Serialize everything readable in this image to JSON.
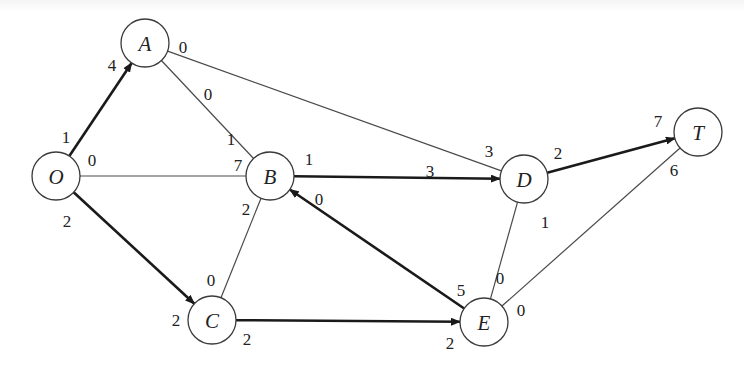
{
  "diagram": {
    "type": "network-flow",
    "colors": {
      "background": "#ffffff",
      "node_stroke": "#3a3a3a",
      "thin_edge": "#4a4a4a",
      "thick_edge": "#1a1a1a",
      "text": "#222222"
    },
    "nodes": [
      {
        "id": "O",
        "label": "O",
        "x": 56,
        "y": 176
      },
      {
        "id": "A",
        "label": "A",
        "x": 145,
        "y": 43
      },
      {
        "id": "B",
        "label": "B",
        "x": 270,
        "y": 176
      },
      {
        "id": "C",
        "label": "C",
        "x": 212,
        "y": 320
      },
      {
        "id": "D",
        "label": "D",
        "x": 524,
        "y": 179
      },
      {
        "id": "E",
        "label": "E",
        "x": 484,
        "y": 322
      },
      {
        "id": "T",
        "label": "T",
        "x": 698,
        "y": 132
      }
    ],
    "edges": [
      {
        "from": "O",
        "to": "A",
        "directed": true,
        "bold": true,
        "label_from": "1",
        "label_to": "4"
      },
      {
        "from": "O",
        "to": "B",
        "directed": false,
        "bold": false,
        "label_from": "0",
        "label_to": "7"
      },
      {
        "from": "O",
        "to": "C",
        "directed": true,
        "bold": true,
        "label_from": "2",
        "label_to": "2"
      },
      {
        "from": "A",
        "to": "B",
        "directed": false,
        "bold": false,
        "label_from": "0",
        "label_to": "1"
      },
      {
        "from": "A",
        "to": "D",
        "directed": false,
        "bold": false,
        "label_from": "0",
        "label_to": "3"
      },
      {
        "from": "B",
        "to": "D",
        "directed": true,
        "bold": true,
        "label_from": "1",
        "label_to": "3"
      },
      {
        "from": "B",
        "to": "C",
        "directed": false,
        "bold": false,
        "label_from": "2",
        "label_to": "0"
      },
      {
        "from": "E",
        "to": "B",
        "directed": true,
        "bold": true,
        "label_from": "5",
        "label_to": "0"
      },
      {
        "from": "C",
        "to": "E",
        "directed": true,
        "bold": true,
        "label_from": "2",
        "label_to": "2"
      },
      {
        "from": "D",
        "to": "T",
        "directed": true,
        "bold": true,
        "label_from": "2",
        "label_to": "7"
      },
      {
        "from": "D",
        "to": "E",
        "directed": false,
        "bold": false,
        "label_from": "1",
        "label_to": "0"
      },
      {
        "from": "E",
        "to": "T",
        "directed": false,
        "bold": false,
        "label_from": "0",
        "label_to": "6"
      }
    ],
    "labels": [
      {
        "text": "1",
        "x": 66,
        "y": 137
      },
      {
        "text": "4",
        "x": 112,
        "y": 65
      },
      {
        "text": "0",
        "x": 92,
        "y": 160
      },
      {
        "text": "7",
        "x": 238,
        "y": 165
      },
      {
        "text": "2",
        "x": 67,
        "y": 221
      },
      {
        "text": "2",
        "x": 176,
        "y": 320
      },
      {
        "text": "0",
        "x": 183,
        "y": 47
      },
      {
        "text": "1",
        "x": 231,
        "y": 139
      },
      {
        "text": "0",
        "x": 208,
        "y": 94
      },
      {
        "text": "3",
        "x": 489,
        "y": 151
      },
      {
        "text": "1",
        "x": 309,
        "y": 159
      },
      {
        "text": "3",
        "x": 430,
        "y": 171
      },
      {
        "text": "2",
        "x": 246,
        "y": 209
      },
      {
        "text": "0",
        "x": 211,
        "y": 280
      },
      {
        "text": "0",
        "x": 319,
        "y": 199
      },
      {
        "text": "5",
        "x": 461,
        "y": 290
      },
      {
        "text": "2",
        "x": 247,
        "y": 339
      },
      {
        "text": "2",
        "x": 450,
        "y": 343
      },
      {
        "text": "2",
        "x": 558,
        "y": 153
      },
      {
        "text": "7",
        "x": 658,
        "y": 121
      },
      {
        "text": "1",
        "x": 545,
        "y": 222
      },
      {
        "text": "0",
        "x": 500,
        "y": 278
      },
      {
        "text": "0",
        "x": 521,
        "y": 310
      },
      {
        "text": "6",
        "x": 674,
        "y": 170
      }
    ]
  }
}
